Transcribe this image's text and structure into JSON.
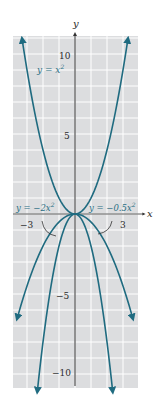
{
  "chart_data": {
    "type": "line",
    "title": "",
    "xlabel": "x",
    "ylabel": "y",
    "xlim": [
      -3.8,
      4.0
    ],
    "ylim": [
      -10.8,
      11.2
    ],
    "grid": true,
    "x_ticks_labeled": [
      "-3",
      "3"
    ],
    "y_ticks_labeled": [
      "10",
      "5",
      "-5",
      "-10"
    ],
    "series": [
      {
        "name": "y = x^2",
        "label": "y = x",
        "exponent": "2",
        "coef": 1
      },
      {
        "name": "y = -2x^2",
        "label": "y = −2x",
        "exponent": "2",
        "coef": -2
      },
      {
        "name": "y = -0.5x^2",
        "label": "y = −0.5x",
        "exponent": "2",
        "coef": -0.5
      }
    ]
  },
  "colors": {
    "curve": "#1f6b80",
    "grid_bg": "#dcdddf",
    "grid_line": "#ffffff",
    "axis": "#333333"
  },
  "axes": {
    "x_label": "x",
    "y_label": "y",
    "tick_10": "10",
    "tick_5": "5",
    "tick_m5": "−5",
    "tick_m10": "−10",
    "tick_m3": "−3",
    "tick_3": "3"
  },
  "labels": {
    "pos_eq": "y = x",
    "neg2_eq": "y = −2x",
    "neg05_eq": "y = −0.5x",
    "sup": "2"
  }
}
